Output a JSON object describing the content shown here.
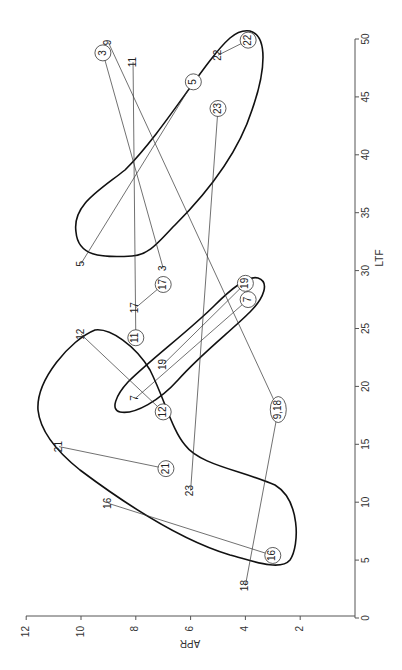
{
  "chart_data": {
    "type": "scatter",
    "title": "",
    "orientation": "rotated-90-clockwise",
    "xlabel": "LTF",
    "ylabel": "APR",
    "xlim": [
      0,
      50
    ],
    "ylim": [
      0,
      12
    ],
    "x_ticks": [
      0,
      5,
      10,
      15,
      20,
      25,
      30,
      35,
      40,
      45,
      50
    ],
    "y_ticks": [
      2,
      4,
      6,
      8,
      10,
      12
    ],
    "grid": false,
    "legend": null,
    "pairs": [
      {
        "id": "3",
        "plain": {
          "LTF": 30.2,
          "APR": 7.0
        },
        "circled": {
          "LTF": 48.8,
          "APR": 9.2
        }
      },
      {
        "id": "5",
        "plain": {
          "LTF": 30.6,
          "APR": 10.0
        },
        "circled": {
          "LTF": 46.3,
          "APR": 5.9
        }
      },
      {
        "id": "7",
        "plain": {
          "LTF": 19.0,
          "APR": 8.0
        },
        "circled": {
          "LTF": 27.5,
          "APR": 3.9
        }
      },
      {
        "id": "9",
        "plain": {
          "LTF": 49.7,
          "APR": 9.0
        },
        "circled": {
          "LTF": 18.0,
          "APR": 2.8
        },
        "circled_label": "9,18"
      },
      {
        "id": "11",
        "plain": {
          "LTF": 48.0,
          "APR": 8.1
        },
        "circled": {
          "LTF": 24.2,
          "APR": 8.0
        }
      },
      {
        "id": "12",
        "plain": {
          "LTF": 24.5,
          "APR": 10.0
        },
        "circled": {
          "LTF": 17.8,
          "APR": 7.0
        }
      },
      {
        "id": "16",
        "plain": {
          "LTF": 9.9,
          "APR": 9.0
        },
        "circled": {
          "LTF": 5.4,
          "APR": 3.0
        }
      },
      {
        "id": "17",
        "plain": {
          "LTF": 26.8,
          "APR": 8.0
        },
        "circled": {
          "LTF": 28.8,
          "APR": 7.0
        }
      },
      {
        "id": "18",
        "plain": {
          "LTF": 2.8,
          "APR": 4.0
        },
        "circled": {
          "LTF": 18.0,
          "APR": 2.8
        },
        "circled_label": "9,18"
      },
      {
        "id": "19",
        "plain": {
          "LTF": 21.9,
          "APR": 7.0
        },
        "circled": {
          "LTF": 28.9,
          "APR": 4.0
        }
      },
      {
        "id": "21",
        "plain": {
          "LTF": 14.8,
          "APR": 10.8
        },
        "circled": {
          "LTF": 12.9,
          "APR": 6.9
        }
      },
      {
        "id": "22",
        "plain": {
          "LTF": 48.6,
          "APR": 5.0
        },
        "circled": {
          "LTF": 49.9,
          "APR": 3.9
        }
      },
      {
        "id": "23",
        "plain": {
          "LTF": 11.0,
          "APR": 6.0
        },
        "circled": {
          "LTF": 44.0,
          "APR": 5.0
        }
      }
    ],
    "annotations": [
      "three closed contour enclosures (upper-right cluster, middle elongated cluster, lower-left boomerang cluster)"
    ]
  }
}
